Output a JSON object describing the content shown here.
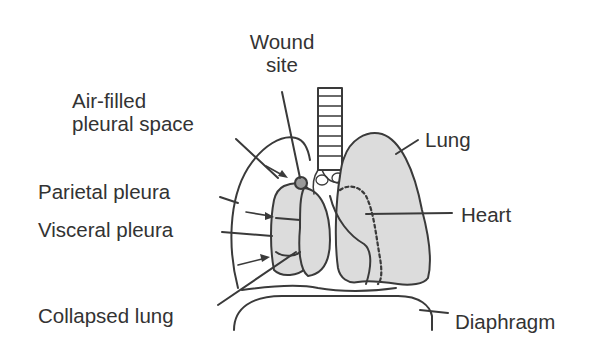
{
  "diagram": {
    "labels": {
      "wound_site_line1": "Wound",
      "wound_site_line2": "site",
      "air_filled_line1": "Air-filled",
      "air_filled_line2": "pleural space",
      "parietal_pleura": "Parietal pleura",
      "visceral_pleura": "Visceral pleura",
      "collapsed_lung": "Collapsed lung",
      "lung": "Lung",
      "heart": "Heart",
      "diaphragm": "Diaphragm"
    },
    "colors": {
      "line": "#3a3a3a",
      "lung_fill": "#dcdcdc",
      "wound_fill": "#9a9a9a",
      "text": "#333333",
      "background": "#ffffff"
    }
  }
}
